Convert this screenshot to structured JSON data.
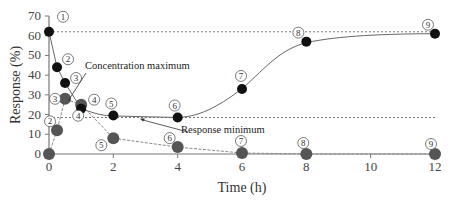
{
  "chart_data": {
    "type": "line",
    "title": "",
    "xlabel": "Time (h)",
    "ylabel": "Response (%)",
    "xlim": [
      0,
      12
    ],
    "ylim": [
      0,
      70
    ],
    "xticks": [
      0,
      2,
      4,
      6,
      8,
      10,
      12
    ],
    "yticks": [
      0,
      10,
      20,
      30,
      40,
      50,
      60,
      70
    ],
    "grid": false,
    "series": [
      {
        "name": "Response",
        "color": "#111111",
        "x": [
          0,
          0.25,
          0.5,
          1,
          2,
          4,
          6,
          8,
          12
        ],
        "values": [
          62,
          44,
          36,
          23,
          19.5,
          18.5,
          33,
          57,
          61
        ],
        "labels": [
          "1",
          "2",
          "3",
          "4",
          "5",
          "6",
          "7",
          "8",
          "9"
        ]
      },
      {
        "name": "Concentration",
        "color": "#555555",
        "x": [
          0,
          0.25,
          0.5,
          1,
          2,
          4,
          6,
          8,
          12
        ],
        "values": [
          0,
          12,
          28,
          25,
          8,
          3.5,
          0.5,
          0,
          0
        ],
        "labels": [
          "1",
          "2",
          "3",
          "4",
          "5",
          "6",
          "7",
          "8",
          "9"
        ]
      }
    ],
    "reference_lines": [
      {
        "y": 62,
        "style": "dotted"
      },
      {
        "y": 18.5,
        "style": "dotted"
      }
    ],
    "annotations": [
      {
        "text": "Concentration maximum",
        "points_to": {
          "x": 0.6,
          "y": 27
        }
      },
      {
        "text": "Response minimum",
        "points_to": {
          "x": 2.8,
          "y": 18.5
        }
      }
    ]
  }
}
